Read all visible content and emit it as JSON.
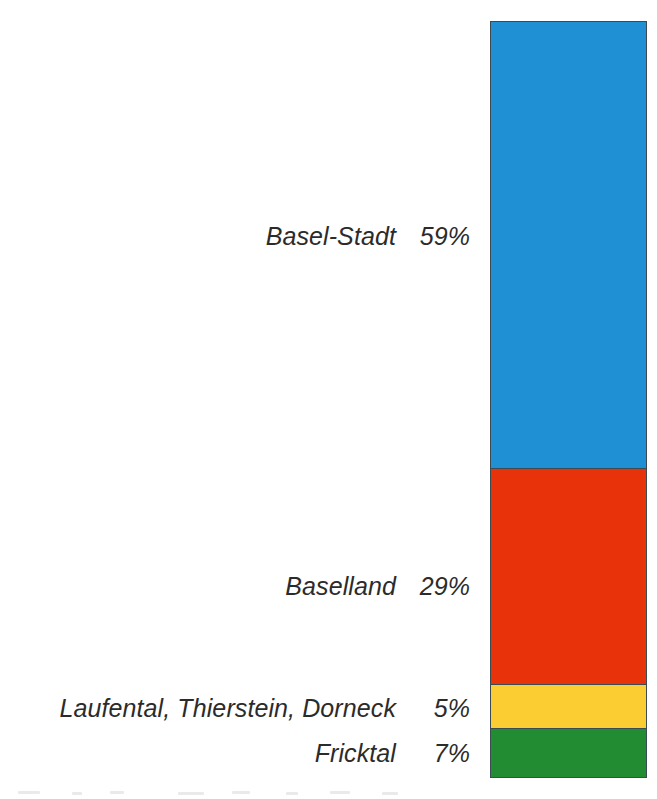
{
  "chart_data": {
    "type": "bar",
    "subtype": "stacked-single-bar-100-percent",
    "title": "",
    "subtitle": "",
    "xlabel": "",
    "ylabel": "",
    "categories": [
      "Basel-Stadt",
      "Baselland",
      "Laufental, Thierstein, Dorneck",
      "Fricktal"
    ],
    "values": [
      59,
      29,
      5,
      7
    ],
    "value_labels": [
      "59%",
      "29%",
      "5%",
      "7%"
    ],
    "unit": "%",
    "ylim": [
      0,
      100
    ],
    "grid": false,
    "legend": "inline-left-labels",
    "orientation": "vertical",
    "stack_order_top_to_bottom": [
      "Basel-Stadt",
      "Baselland",
      "Laufental, Thierstein, Dorneck",
      "Fricktal"
    ],
    "colors": [
      "#2090d5",
      "#e8320a",
      "#fccd33",
      "#218c32"
    ],
    "series": [
      {
        "name": "Anteil",
        "values": [
          59,
          29,
          5,
          7
        ]
      }
    ]
  },
  "chart": {
    "segments": [
      {
        "name": "Basel-Stadt",
        "value_label": "59%",
        "value": 59,
        "color": "#2090d5",
        "height_pct": "59.05%"
      },
      {
        "name": "Baselland",
        "value_label": "29%",
        "value": 29,
        "color": "#e8320a",
        "height_pct": "28.66%"
      },
      {
        "name": "Laufental, Thierstein, Dorneck",
        "value_label": "5%",
        "value": 5,
        "color": "#fccd33",
        "height_pct": "5.81%"
      },
      {
        "name": "Fricktal",
        "value_label": "7%",
        "value": 7,
        "color": "#218c32",
        "height_pct": "6.48%"
      }
    ],
    "border_color": "#3c4a52",
    "background": "#ffffff"
  }
}
